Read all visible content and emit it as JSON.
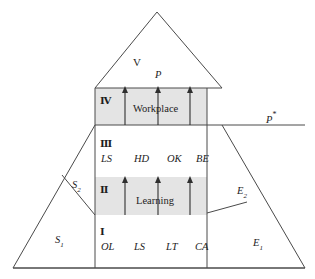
{
  "figure": {
    "type": "pyramid-diagram",
    "background_color": "#ffffff",
    "line_color": "#4a4a4a",
    "band_color": "#e3e3e3"
  },
  "levels": {
    "five": {
      "numeral": "V",
      "performance_label": "P"
    },
    "four": {
      "numeral": "Ⅳ",
      "title": "Workplace"
    },
    "three": {
      "numeral": "Ⅲ",
      "items": [
        "LS",
        "HD",
        "OK",
        "BE"
      ]
    },
    "two": {
      "numeral": "Ⅱ",
      "title": "Learning"
    },
    "one": {
      "numeral": "Ⅰ",
      "items": [
        "OL",
        "LS",
        "LT",
        "CA"
      ]
    }
  },
  "side_labels": {
    "left_upper": {
      "base": "S",
      "sub": "2"
    },
    "left_lower": {
      "base": "S",
      "sub": "1"
    },
    "right_upper": {
      "base": "E",
      "sub": "2"
    },
    "right_lower": {
      "base": "E",
      "sub": "1"
    },
    "reference_line": {
      "base": "P",
      "mark": "*"
    }
  }
}
